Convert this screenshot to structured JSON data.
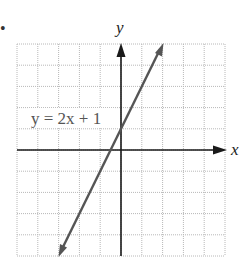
{
  "chart_data": {
    "type": "line",
    "title": "",
    "xlabel": "x",
    "ylabel": "y",
    "xlim": [
      -5,
      5
    ],
    "ylim": [
      -5,
      5
    ],
    "grid": true,
    "grid_step": 1,
    "legend": "none",
    "series": [
      {
        "name": "y = 2x + 1",
        "equation": "y = 2x + 1",
        "slope": 2,
        "intercept": 1,
        "x": [
          -3,
          2
        ],
        "y": [
          -5,
          5
        ],
        "arrows": "both",
        "color": "#555555"
      }
    ],
    "annotations": [
      {
        "text": "y = 2x + 1",
        "x": -4.5,
        "y": 1.5
      }
    ]
  },
  "labels": {
    "x_axis": "x",
    "y_axis": "y",
    "equation": "y = 2x + 1",
    "bullet": "•"
  },
  "colors": {
    "axes": "#1a1a1a",
    "line": "#555555",
    "grid": "#b8b8b8"
  }
}
